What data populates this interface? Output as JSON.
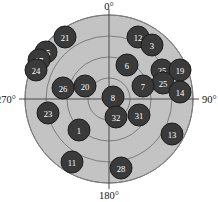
{
  "chart_data": {
    "type": "scatter",
    "projection": "polar",
    "title": "",
    "xlabel": "",
    "ylabel": "",
    "grid": true,
    "legend": null,
    "angle_unit": "degrees",
    "angle_direction": "clockwise",
    "angle_zero_location": "top",
    "axis_tick_labels": [
      "0°",
      "90°",
      "180°",
      "270°"
    ],
    "angular_ticks": [
      0,
      90,
      180,
      270
    ],
    "radial_rings": [
      0.25,
      0.5,
      0.75,
      1.0
    ],
    "rlim": [
      0,
      1
    ],
    "colors": {
      "disk_fill": "#c3c3c3",
      "ring_line": "#7d7d7d",
      "axis_line": "#4a4a4a",
      "point_fill": "#3a3a3a",
      "point_stroke": "#1c1c1c",
      "point_label": "#ffffff",
      "background": "#ffffff",
      "text": "#141414"
    },
    "points": [
      {
        "label": "21",
        "theta": 339,
        "r": 0.79,
        "x": 65,
        "y": 37
      },
      {
        "label": "12",
        "theta": 20,
        "r": 0.8,
        "x": 138,
        "y": 37
      },
      {
        "label": "3",
        "theta": 28,
        "r": 0.84,
        "x": 152,
        "y": 45
      },
      {
        "label": "15",
        "theta": 311,
        "r": 0.88,
        "x": 46,
        "y": 52
      },
      {
        "label": "17",
        "theta": 305,
        "r": 0.93,
        "x": 39,
        "y": 60
      },
      {
        "label": "24",
        "theta": 300,
        "r": 0.95,
        "x": 36,
        "y": 70
      },
      {
        "label": "6",
        "theta": 19,
        "r": 0.47,
        "x": 127,
        "y": 65
      },
      {
        "label": "25",
        "theta": 47,
        "r": 0.75,
        "x": 162,
        "y": 70
      },
      {
        "label": "19",
        "theta": 52,
        "r": 0.87,
        "x": 180,
        "y": 70
      },
      {
        "label": "25",
        "theta": 51,
        "r": 0.69,
        "x": 163,
        "y": 83
      },
      {
        "label": "7",
        "theta": 46,
        "r": 0.42,
        "x": 143,
        "y": 86
      },
      {
        "label": "26",
        "theta": 288,
        "r": 0.66,
        "x": 63,
        "y": 88
      },
      {
        "label": "20",
        "theta": 295,
        "r": 0.52,
        "x": 85,
        "y": 86
      },
      {
        "label": "14",
        "theta": 76,
        "r": 0.83,
        "x": 180,
        "y": 92
      },
      {
        "label": "8",
        "theta": 22,
        "r": 0.14,
        "x": 113,
        "y": 97
      },
      {
        "label": "23",
        "theta": 256,
        "r": 0.71,
        "x": 48,
        "y": 113
      },
      {
        "label": "32",
        "theta": 172,
        "r": 0.22,
        "x": 116,
        "y": 117
      },
      {
        "label": "31",
        "theta": 134,
        "r": 0.33,
        "x": 139,
        "y": 115
      },
      {
        "label": "1",
        "theta": 228,
        "r": 0.55,
        "x": 79,
        "y": 130
      },
      {
        "label": "13",
        "theta": 126,
        "r": 0.8,
        "x": 172,
        "y": 134
      },
      {
        "label": "11",
        "theta": 222,
        "r": 0.85,
        "x": 72,
        "y": 162
      },
      {
        "label": "28",
        "theta": 181,
        "r": 0.82,
        "x": 121,
        "y": 168
      }
    ]
  },
  "plot": {
    "center_x": 109,
    "center_y": 99,
    "outer_radius": 84,
    "rings": [
      21,
      42,
      63,
      84
    ],
    "point_radius": 11,
    "labels": {
      "top": "0°",
      "right": "90°",
      "bottom": "180°",
      "left": "270°"
    }
  }
}
